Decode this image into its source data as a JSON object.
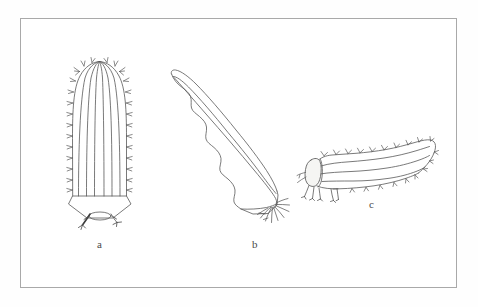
{
  "figure": {
    "background_color": "#fefefe",
    "frame": {
      "border_color": "#a9a9a9",
      "fill_color": "#ffffff",
      "x": 20,
      "y": 18,
      "width": 437,
      "height": 270
    },
    "ink_color": "#555555",
    "panels": [
      {
        "id": "a",
        "label": "a",
        "caption_position": {
          "x": 97,
          "y": 238
        },
        "description": "Elongate barrel-shaped larva, dorsal view, with longitudinal ribs, marginal spines and terminal appendages",
        "rib_count": 6,
        "spine_count_per_side": 13
      },
      {
        "id": "b",
        "label": "b",
        "caption_position": {
          "x": 252,
          "y": 238
        },
        "description": "Elongate tapering larva in oblique view with lobed scalloped margin and a tuft of basal filaments",
        "lobe_count": 6,
        "filament_count": 9
      },
      {
        "id": "c",
        "label": "c",
        "caption_position": {
          "x": 369,
          "y": 198
        },
        "description": "Caterpillar-like larva, lateral view, with head capsule, segmented wavy body lines, dorsal and ventral setae, and thoracic legs",
        "body_line_count": 3,
        "leg_count": 5,
        "seta_count": 19
      }
    ]
  }
}
